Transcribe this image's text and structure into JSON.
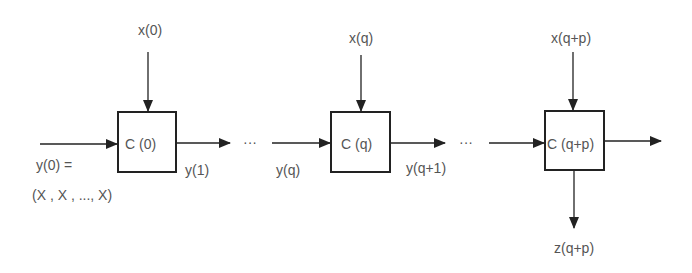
{
  "diagram": {
    "stages": [
      {
        "cell_label": "C (0)",
        "input_x": "x(0)",
        "input_y": "y(0) =",
        "input_y_value": "(X , X , ..., X)",
        "output_y": "y(1)"
      },
      {
        "cell_label": "C (q)",
        "input_x": "x(q)",
        "input_y": "y(q)",
        "output_y": "y(q+1)"
      },
      {
        "cell_label": "C (q+p)",
        "input_x": "x(q+p)",
        "output_z": "z(q+p)"
      }
    ],
    "ellipsis": "···",
    "colors": {
      "line": "#222222",
      "text": "#555555"
    }
  }
}
